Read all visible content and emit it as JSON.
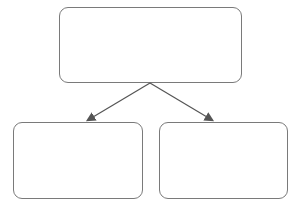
{
  "diagram": {
    "type": "part-whole split",
    "colors": {
      "border": "#7a7a7a",
      "arrow": "#555555",
      "apple_dark": "#6e6262",
      "apple_light": "#a89c9c"
    },
    "top_box": {
      "label": "whole",
      "apple_count": 10,
      "rows": 2,
      "cols": 5
    },
    "bottom_left_box": {
      "label": "part-known",
      "apple_count": 5
    },
    "bottom_right_box": {
      "label": "part-unknown",
      "apple_count": 0
    }
  }
}
